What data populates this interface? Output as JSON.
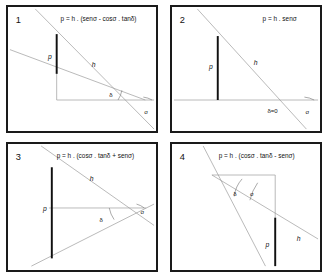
{
  "figure": {
    "background_color": "#ffffff",
    "border_color": "#1a1a1a",
    "line_color_light": "#9a9a9a",
    "line_color_dark": "#111111"
  },
  "panels": [
    {
      "number": "1",
      "formula": "p = h . (senσ - cosσ . tanδ)",
      "labels": {
        "p": "p",
        "h": "h",
        "delta": "δ",
        "alpha": "σ"
      }
    },
    {
      "number": "2",
      "formula": "p = h . senσ",
      "labels": {
        "p": "p",
        "h": "h",
        "delta": "δ=0",
        "alpha": "σ"
      }
    },
    {
      "number": "3",
      "formula": "p = h . (cosσ . tanδ + senσ)",
      "labels": {
        "p": "p",
        "h": "h",
        "delta": "δ",
        "alpha": "σ"
      }
    },
    {
      "number": "4",
      "formula": "p = h . (cosσ . tanδ - senσ)",
      "labels": {
        "p": "p",
        "h": "h",
        "delta": "δ",
        "alpha": "σ"
      }
    }
  ]
}
